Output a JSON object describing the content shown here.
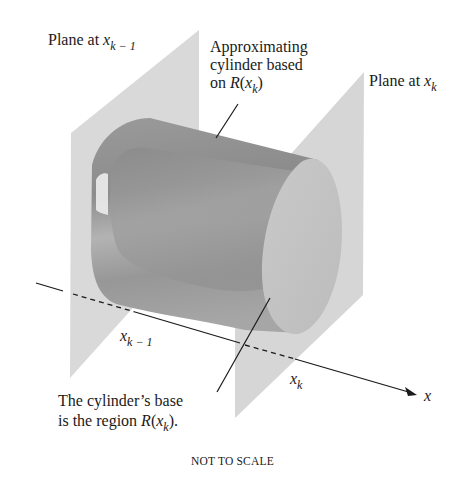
{
  "diagram": {
    "labels": {
      "plane_left": {
        "text": "Plane at ",
        "var": "x",
        "sub": "k − 1"
      },
      "plane_right": {
        "text": "Plane at ",
        "var": "x",
        "sub": "k"
      },
      "cylinder_line1": "Approximating",
      "cylinder_line2": "cylinder based",
      "cylinder_line3_prefix": "on ",
      "cylinder_line3_R": "R",
      "cylinder_line3_open": "(",
      "cylinder_line3_var": "x",
      "cylinder_line3_sub": "k",
      "cylinder_line3_close": ")",
      "base_line1": "The cylinder’s base",
      "base_line2_prefix": "is the region ",
      "base_line2_R": "R",
      "base_line2_open": "(",
      "base_line2_var": "x",
      "base_line2_sub": "k",
      "base_line2_close": ").",
      "axis_left_tick": {
        "var": "x",
        "sub": "k − 1"
      },
      "axis_right_tick": {
        "var": "x",
        "sub": "k"
      },
      "axis_name": "x",
      "caption": "NOT TO SCALE"
    },
    "colors": {
      "plane": "#d6d6d6",
      "cylinder_dark": "#8f8f8f",
      "cylinder_mid": "#a9a9a9",
      "cylinder_face": "#c4c4c4",
      "line": "#1a1a1a"
    }
  }
}
